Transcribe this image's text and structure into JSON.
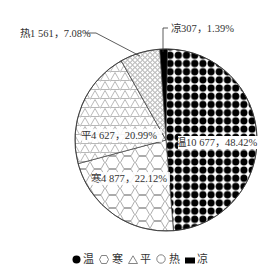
{
  "chart_data": {
    "type": "pie",
    "title": "",
    "unit_note": "count, percent",
    "start_angle_deg": -4,
    "direction": "clockwise",
    "slices": [
      {
        "name": "凉",
        "value": 307,
        "percent": 1.39,
        "pattern": "solid-black",
        "label": "凉307，1.39%"
      },
      {
        "name": "温",
        "value": 10677,
        "percent": 48.42,
        "pattern": "black-dots",
        "label": "温10 677，48.42%"
      },
      {
        "name": "寒",
        "value": 4877,
        "percent": 22.12,
        "pattern": "hexagons",
        "label": "寒4 877，22.12%"
      },
      {
        "name": "平",
        "value": 4627,
        "percent": 20.99,
        "pattern": "triangles",
        "label": "平4 627，20.99%"
      },
      {
        "name": "热",
        "value": 1561,
        "percent": 7.08,
        "pattern": "small-circles",
        "label": "热1 561，7.08%"
      }
    ],
    "legend": {
      "position": "bottom",
      "entries": [
        {
          "name": "温",
          "marker": "filled-circle"
        },
        {
          "name": "寒",
          "marker": "hexagon-outline"
        },
        {
          "name": "平",
          "marker": "triangle-outline"
        },
        {
          "name": "热",
          "marker": "circle-outline"
        },
        {
          "name": "凉",
          "marker": "filled-rect"
        }
      ]
    }
  },
  "labels": {
    "liang": "凉307，1.39%",
    "wen": "温10 677，48.42%",
    "han": "寒4 877，22.12%",
    "ping": "平4 627，20.99%",
    "re": "热1 561，7.08%"
  },
  "legend": {
    "wen": "温",
    "han": "寒",
    "ping": "平",
    "re": "热",
    "liang": "凉"
  }
}
